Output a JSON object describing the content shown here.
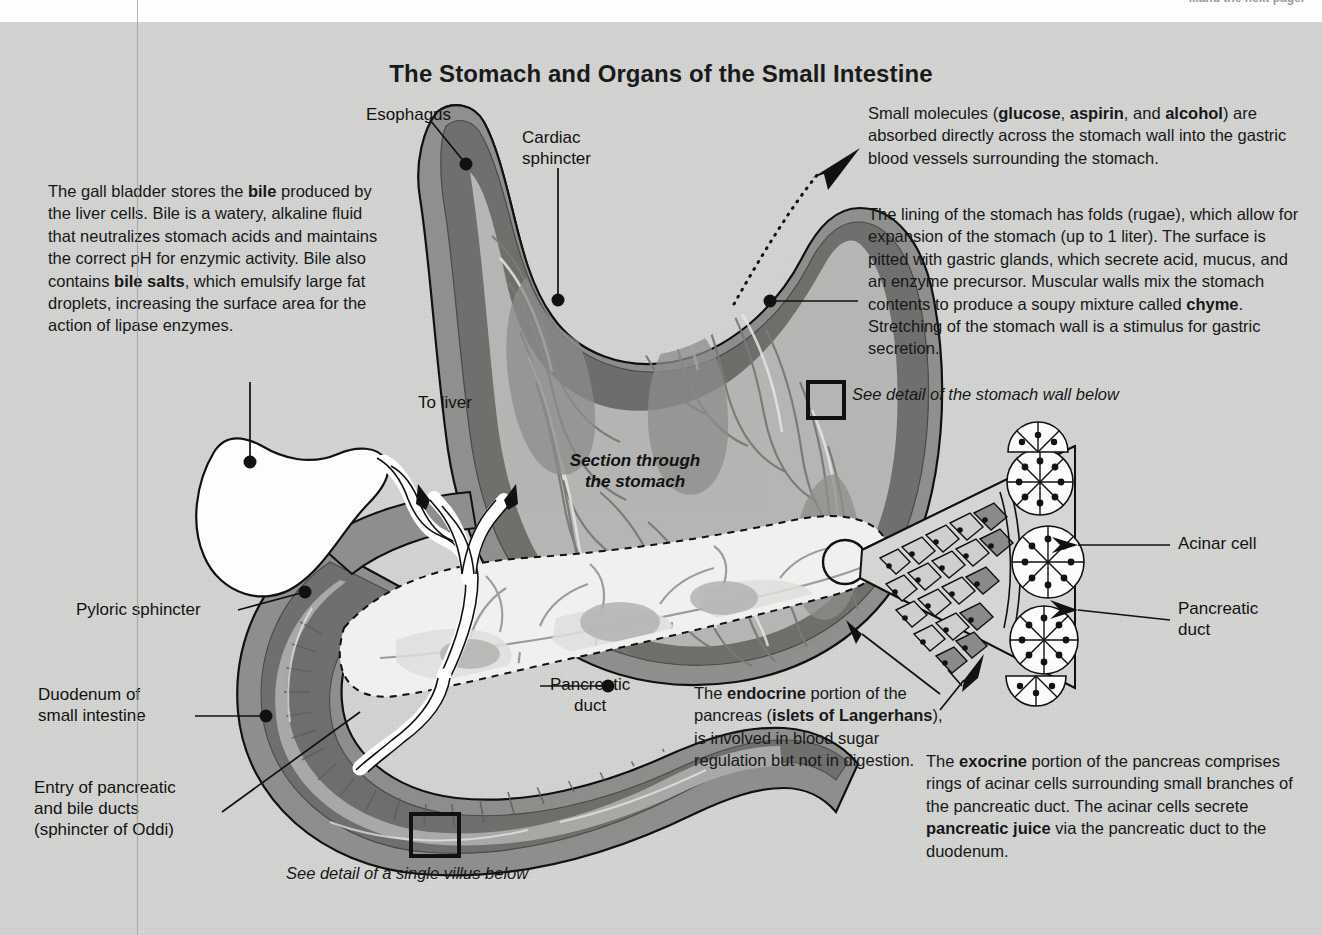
{
  "page": {
    "background_color": "#d5d5d3",
    "running_head_right": "...and the next page.",
    "running_head_left": "",
    "title": "The Stomach and Organs of the Small Intestine"
  },
  "paragraphs": {
    "gall_bladder": "The gall bladder stores the |bile| produced by the liver cells. Bile is a watery, alkaline fluid that neutralizes stomach acids and maintains the correct pH for enzymic activity. Bile also contains |bile salts|, which emulsify large fat droplets, increasing the surface area for the action of lipase enzymes.",
    "small_molecules": "Small molecules (|glucose|, |aspirin|, and |alcohol|) are absorbed directly across the stomach wall into the gastric blood vessels surrounding the stomach.",
    "stomach_lining": "The lining of the stomach has folds (rugae), which allow for expansion of the stomach (up to 1 liter). The surface is pitted with gastric glands, which secrete acid, mucus, and an enzyme precursor. Muscular walls mix the stomach contents to produce a soupy mixture called |chyme|. Stretching of the stomach wall is a stimulus for gastric secretion.",
    "endocrine": "The |endocrine| portion of the pancreas (|islets of Langerhans|), is involved in blood sugar regulation but not in digestion.",
    "exocrine": "The |exocrine| portion of the pancreas comprises rings of acinar cells surrounding small branches of the pancreatic duct. The acinar cells secrete |pancreatic juice| via the pancreatic duct to the duodenum."
  },
  "labels": {
    "esophagus": "Esophagus",
    "cardiac_sphincter": "Cardiac\nsphincter",
    "to_liver": "To liver",
    "section_through_stomach": "Section through\nthe stomach",
    "pyloric_sphincter": "Pyloric sphincter",
    "duodenum": "Duodenum of\nsmall intestine",
    "entry_ducts": "Entry of pancreatic\nand bile ducts\n(sphincter of Oddi)",
    "pancreatic_duct_center": "Pancreatic\nduct",
    "acinar_cell": "Acinar cell",
    "pancreatic_duct_right": "Pancreatic\nduct"
  },
  "captions": {
    "stomach_wall_detail": "See detail of the stomach wall below",
    "villus_detail": "See detail of a single villus below"
  },
  "colors": {
    "page_bg": "#d5d5d3",
    "outline": "#111111",
    "serosa": "#8e8e8c",
    "muscle_dark": "#6f6f6d",
    "mucosa_mid": "#a8a8a6",
    "lumen_light": "#c9c9c7",
    "pancreas_light": "#efefed",
    "gallbladder": "#fdfdfd",
    "islet_dark": "#848482"
  }
}
